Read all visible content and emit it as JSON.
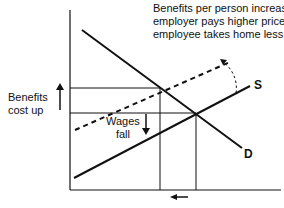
{
  "annotation": {
    "lines": [
      "Benefits per person increase,",
      "employer pays higher price,",
      "employee takes home less."
    ]
  },
  "left_label": {
    "lines": [
      "Benefits",
      "cost up"
    ],
    "arrow": "up-arrow"
  },
  "wages_label": {
    "lines": [
      "Wages",
      "fall"
    ],
    "arrow": "down-arrow"
  },
  "curves": {
    "supply_label": "S",
    "demand_label": "D",
    "shifted_supply_style": "dashed",
    "shift_arrow": "curved-dashed-arrow"
  },
  "bottom_arrow": "left-arrow",
  "colors": {
    "ink": "#111111",
    "background": "#ffffff"
  }
}
